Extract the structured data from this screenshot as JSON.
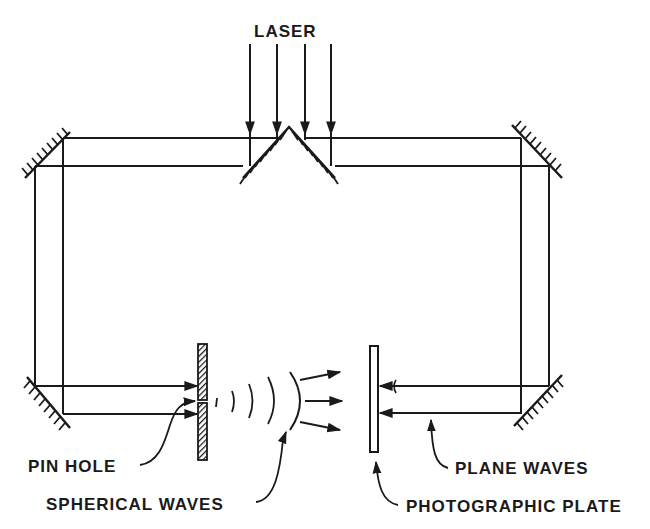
{
  "diagram": {
    "labels": {
      "laser": "LASER",
      "pin_hole": "PIN HOLE",
      "spherical_waves": "SPHERICAL WAVES",
      "plane_waves": "PLANE WAVES",
      "photographic_plate": "PHOTOGRAPHIC PLATE"
    },
    "colors": {
      "ink": "#1a1a1a",
      "background": "#ffffff"
    }
  }
}
